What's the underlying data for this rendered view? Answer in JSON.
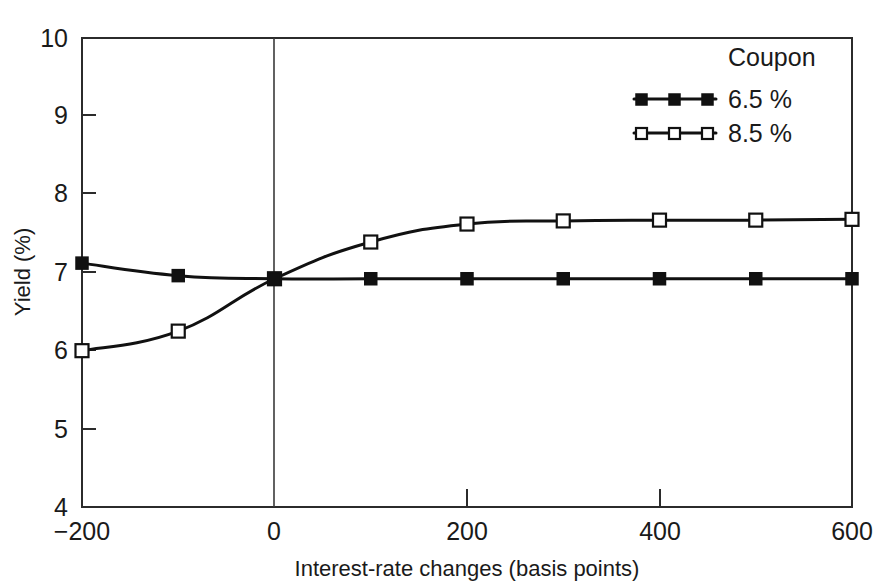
{
  "chart_data": {
    "type": "line",
    "title": "",
    "subtitle": "",
    "xlabel": "Interest-rate changes (basis points)",
    "ylabel": "Yield (%)",
    "xlim": [
      -200,
      600
    ],
    "ylim": [
      4,
      10
    ],
    "xticks": [
      -200,
      0,
      200,
      400,
      600
    ],
    "xtick_labels": [
      "−200",
      "0",
      "200",
      "400",
      "600"
    ],
    "yticks": [
      4,
      5,
      6,
      7,
      8,
      9,
      10
    ],
    "ytick_labels": [
      "4",
      "5",
      "6",
      "7",
      "8",
      "9",
      "10"
    ],
    "grid": false,
    "legend_position": "top-right",
    "legend_title": "Coupon",
    "annotations": [
      {
        "name": "zero-reference-line",
        "type": "vline",
        "x": 0
      }
    ],
    "x": [
      -200,
      -100,
      0,
      100,
      200,
      300,
      400,
      500,
      600
    ],
    "series": [
      {
        "name": "6.5 %",
        "marker": "filled-square",
        "color": "#111111",
        "values": [
          7.12,
          6.96,
          6.92,
          6.92,
          6.92,
          6.92,
          6.92,
          6.92,
          6.92
        ]
      },
      {
        "name": "8.5 %",
        "marker": "open-square",
        "color": "#111111",
        "values": [
          6.0,
          6.25,
          6.92,
          7.39,
          7.62,
          7.66,
          7.67,
          7.67,
          7.68
        ]
      }
    ]
  },
  "legend": {
    "title": "Coupon",
    "entries": [
      {
        "label": "6.5 %",
        "marker": "filled-square"
      },
      {
        "label": "8.5 %",
        "marker": "open-square"
      }
    ]
  },
  "axes": {
    "x_title": "Interest-rate changes (basis points)",
    "y_title": "Yield (%)"
  }
}
